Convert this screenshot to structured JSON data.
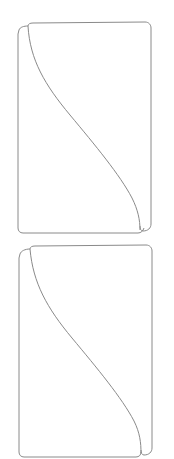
{
  "diagram": {
    "stroke_color": "#8a8a8a",
    "background": "#ffffff",
    "panels": [
      {
        "id": "top-panel",
        "label": ""
      },
      {
        "id": "bottom-panel",
        "label": ""
      }
    ]
  }
}
